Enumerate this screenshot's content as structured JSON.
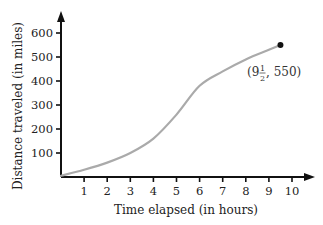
{
  "chart_data": {
    "type": "line",
    "title": "",
    "xlabel": "Time elapsed (in hours)",
    "ylabel": "Distance traveled (in miles)",
    "xlim": [
      0,
      10
    ],
    "ylim": [
      0,
      600
    ],
    "x_ticks": [
      "1",
      "2",
      "3",
      "4",
      "5",
      "6",
      "7",
      "8",
      "9",
      "10"
    ],
    "y_ticks": [
      "100",
      "200",
      "300",
      "400",
      "500",
      "600"
    ],
    "grid": false,
    "legend": null,
    "series": [
      {
        "name": "Distance",
        "color": "#aaaaaa",
        "x": [
          0,
          1,
          2,
          3,
          4,
          5,
          6,
          7,
          8,
          9,
          9.5
        ],
        "y": [
          5,
          30,
          60,
          100,
          160,
          260,
          380,
          440,
          490,
          530,
          550
        ]
      }
    ],
    "annotations": [
      {
        "x": 9.5,
        "y": 550,
        "marker": "dot",
        "text_whole": "(9",
        "text_frac_num": "1",
        "text_frac_den": "2",
        "text_rest": ", 550)"
      }
    ]
  }
}
